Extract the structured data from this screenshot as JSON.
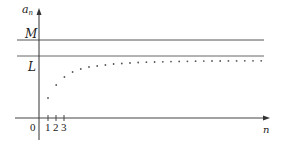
{
  "diagram": {
    "y_axis_label": "a",
    "y_axis_label_sub": "n",
    "x_axis_label": "n",
    "origin_label": "0",
    "upper_bound_label": "M",
    "limit_label": "L",
    "x_ticks": [
      "1",
      "2",
      "3"
    ],
    "colors": {
      "axis": "#333333",
      "bound_lines": "#555555",
      "points": "#555555"
    },
    "sequence_points": [
      {
        "n": 1,
        "y": 98
      },
      {
        "n": 2,
        "y": 85
      },
      {
        "n": 3,
        "y": 77
      },
      {
        "n": 4,
        "y": 72
      },
      {
        "n": 5,
        "y": 69
      },
      {
        "n": 6,
        "y": 67
      },
      {
        "n": 7,
        "y": 66
      },
      {
        "n": 8,
        "y": 65
      },
      {
        "n": 9,
        "y": 64
      },
      {
        "n": 10,
        "y": 63.5
      },
      {
        "n": 11,
        "y": 63
      },
      {
        "n": 12,
        "y": 62.5
      },
      {
        "n": 13,
        "y": 62.2
      },
      {
        "n": 14,
        "y": 62
      },
      {
        "n": 15,
        "y": 61.8
      },
      {
        "n": 16,
        "y": 61.6
      },
      {
        "n": 17,
        "y": 61.4
      },
      {
        "n": 18,
        "y": 61.3
      },
      {
        "n": 19,
        "y": 61.2
      },
      {
        "n": 20,
        "y": 61.1
      },
      {
        "n": 21,
        "y": 61
      },
      {
        "n": 22,
        "y": 61
      },
      {
        "n": 23,
        "y": 60.9
      },
      {
        "n": 24,
        "y": 60.9
      },
      {
        "n": 25,
        "y": 60.8
      },
      {
        "n": 26,
        "y": 60.8
      },
      {
        "n": 27,
        "y": 60.8
      }
    ]
  }
}
